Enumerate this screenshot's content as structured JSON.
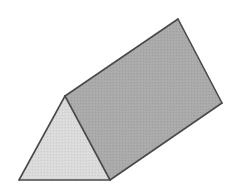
{
  "figure": {
    "canvas": {
      "width": 238,
      "height": 190,
      "background_color": "#ffffff"
    },
    "style": {
      "edge_color": "#4a4a4a",
      "edge_width": 1.6,
      "triangle_face_color": "#d9d9d9",
      "rectangle_face_color": "#a9a9a9",
      "shading": "flat-dithered"
    },
    "vertices": {
      "triangle_bottom_left": {
        "label": "A",
        "x": 19,
        "y": 180
      },
      "triangle_apex": {
        "label": "B",
        "x": 65,
        "y": 96
      },
      "triangle_bottom_right": {
        "label": "C",
        "x": 110,
        "y": 180
      },
      "rect_far_top": {
        "label": "D",
        "x": 178,
        "y": 19
      },
      "rect_far_right": {
        "label": "E",
        "x": 222,
        "y": 103
      }
    },
    "faces": [
      {
        "name": "front-triangular-face",
        "shape": "triangle",
        "fill": "#d9d9d9",
        "points": "19,180 65,96 110,180"
      },
      {
        "name": "upper-rectangular-face",
        "shape": "quadrilateral",
        "fill": "#a9a9a9",
        "points": "65,96 178,19 222,103 110,180"
      }
    ],
    "edges": [
      {
        "name": "triangle-left-edge",
        "from": "A",
        "to": "B",
        "x1": 19,
        "y1": 180,
        "x2": 65,
        "y2": 96
      },
      {
        "name": "triangle-base-edge",
        "from": "A",
        "to": "C",
        "x1": 19,
        "y1": 180,
        "x2": 110,
        "y2": 180
      },
      {
        "name": "triangle-right-edge",
        "from": "B",
        "to": "C",
        "x1": 65,
        "y1": 96,
        "x2": 110,
        "y2": 180
      },
      {
        "name": "prism-top-edge",
        "from": "B",
        "to": "D",
        "x1": 65,
        "y1": 96,
        "x2": 178,
        "y2": 19
      },
      {
        "name": "prism-far-edge",
        "from": "D",
        "to": "E",
        "x1": 178,
        "y1": 19,
        "x2": 222,
        "y2": 103
      },
      {
        "name": "prism-bottom-edge",
        "from": "E",
        "to": "C",
        "x1": 222,
        "y1": 103,
        "x2": 110,
        "y2": 180
      }
    ],
    "labels": []
  }
}
